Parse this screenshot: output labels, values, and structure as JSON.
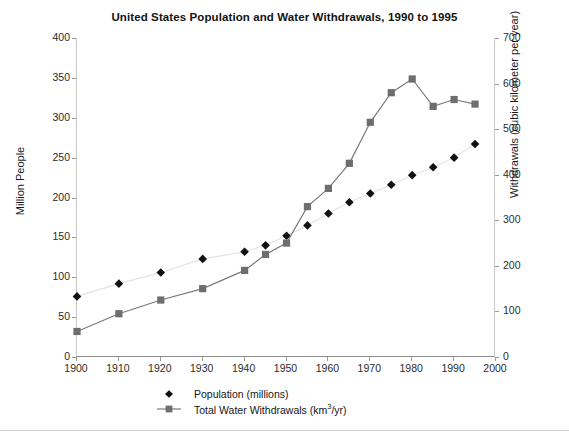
{
  "chart_data": {
    "type": "line",
    "title": "United States Population and Water Withdrawals, 1990 to 1995",
    "xlabel": "",
    "ylabel": "Million People",
    "y2label": "Withdrawals (cubic kilometer per year)",
    "xlim": [
      1900,
      2000
    ],
    "ylim": [
      0,
      400
    ],
    "y2lim": [
      0,
      700
    ],
    "xticks": [
      1900,
      1910,
      1920,
      1930,
      1940,
      1950,
      1960,
      1970,
      1980,
      1990,
      2000
    ],
    "yticks": [
      0,
      50,
      100,
      150,
      200,
      250,
      300,
      350,
      400
    ],
    "y2ticks": [
      0,
      100,
      200,
      300,
      400,
      500,
      600,
      700
    ],
    "grid": false,
    "legend_position": "bottom",
    "series": [
      {
        "name": "Population (millions)",
        "axis": "left",
        "marker": "diamond",
        "color": "#111111",
        "line_color": "#e2e2e2",
        "x": [
          1900,
          1910,
          1920,
          1930,
          1940,
          1945,
          1950,
          1955,
          1960,
          1965,
          1970,
          1975,
          1980,
          1985,
          1990,
          1995
        ],
        "values": [
          76,
          92,
          106,
          123,
          132,
          140,
          152,
          165,
          180,
          194,
          205,
          216,
          228,
          238,
          250,
          267
        ]
      },
      {
        "name": "Total Water Withdrawals (km3/yr)",
        "axis": "right",
        "marker": "square",
        "color": "#6e6e6e",
        "line_color": "#7a7a7a",
        "x": [
          1900,
          1910,
          1920,
          1930,
          1940,
          1945,
          1950,
          1955,
          1960,
          1965,
          1970,
          1975,
          1980,
          1985,
          1990,
          1995
        ],
        "values": [
          56,
          95,
          125,
          150,
          190,
          225,
          250,
          330,
          370,
          425,
          515,
          580,
          610,
          550,
          565,
          555
        ]
      }
    ]
  },
  "legend": {
    "items": [
      {
        "label": "Population (millions)",
        "marker": "diamond"
      },
      {
        "label_prefix": "Total Water Withdrawals (km",
        "label_sup": "3",
        "label_suffix": "/yr)",
        "marker": "square-line"
      }
    ]
  }
}
